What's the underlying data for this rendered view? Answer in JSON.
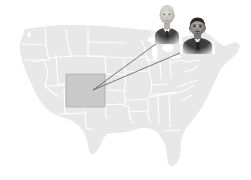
{
  "figure": {
    "type": "annotated-map-illustration",
    "background_color": "#ffffff",
    "width": 251,
    "height": 180,
    "title_text": "",
    "caption_text": ""
  },
  "map": {
    "name": "united-states-map",
    "region": "Contiguous United States",
    "fill_color": "#e8e8e8",
    "border_color": "#ffffff",
    "border_width": 1.1,
    "highlight": {
      "state_name": "Colorado",
      "shape": "rectangle",
      "fill_color": "#c9c9c9",
      "stroke_color": "#b3b3b3",
      "x": 66,
      "y": 74,
      "width": 39,
      "height": 33
    }
  },
  "pointers": {
    "line_color": "#5a5a5a",
    "line_width": 0.8,
    "target_x": 93,
    "target_y": 90,
    "items": [
      {
        "name": "pointer-line-1",
        "from_x": 160,
        "from_y": 41,
        "to_x": 93,
        "to_y": 90
      },
      {
        "name": "pointer-line-2",
        "from_x": 187,
        "from_y": 50,
        "to_x": 93,
        "to_y": 90
      }
    ]
  },
  "portraits": [
    {
      "id": "portrait-1",
      "label": "Portrait of older man in dark suit",
      "description": "Bald/balding older man, light complexion, wearing dark jacket, white collar and dark tie, facing slightly left",
      "tone": "grayscale",
      "skin_color": "#c8c4bd",
      "hair_color": "#d2cfca",
      "suit_color": "#3d3d3d",
      "shirt_color": "#f2f0ec",
      "x": 151,
      "y": 2,
      "width": 31,
      "height": 42
    },
    {
      "id": "portrait-2",
      "label": "Portrait of dark-haired man in dark suit",
      "description": "Man with dark hair and dark moustache, wearing dark suit jacket, white shirt and dark tie, facing slightly left",
      "tone": "grayscale",
      "skin_color": "#8d8984",
      "hair_color": "#262626",
      "suit_color": "#3a3a3a",
      "shirt_color": "#e9e7e3",
      "x": 180,
      "y": 16,
      "width": 35,
      "height": 38
    }
  ],
  "colors": {
    "map_fill": "#e8e8e8",
    "map_border": "#ffffff",
    "highlight_fill": "#c9c9c9",
    "pointer": "#5a5a5a",
    "background": "#ffffff"
  }
}
